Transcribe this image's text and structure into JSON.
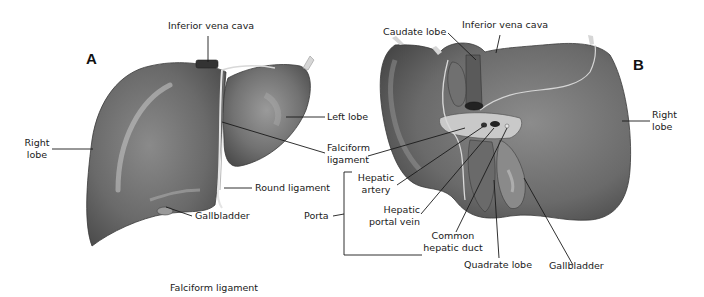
{
  "figure": {
    "panels": [
      {
        "id": "A",
        "letter": "A",
        "view": "anterior",
        "labels": {
          "inferior_vena_cava": "Inferior vena cava",
          "right_lobe_1": "Right",
          "right_lobe_2": "lobe",
          "left_lobe": "Left lobe",
          "falciform_1": "Falciform",
          "falciform_2": "ligament",
          "round_ligament": "Round ligament",
          "gallbladder": "Gallbladder"
        }
      },
      {
        "id": "B",
        "letter": "B",
        "view": "inferior",
        "labels": {
          "caudate_lobe": "Caudate lobe",
          "inferior_vena_cava": "Inferior vena cava",
          "right_lobe_1": "Right",
          "right_lobe_2": "lobe",
          "porta": "Porta",
          "hepatic_artery_1": "Hepatic",
          "hepatic_artery_2": "artery",
          "hepatic_portal_vein_1": "Hepatic",
          "hepatic_portal_vein_2": "portal vein",
          "common_hepatic_duct_1": "Common",
          "common_hepatic_duct_2": "hepatic duct",
          "quadrate_lobe": "Quadrate lobe",
          "gallbladder": "Gallbladder"
        }
      }
    ],
    "caption_fragment": "Falciform ligament",
    "colors": {
      "liver_fill": "#6e6e6e",
      "liver_dark": "#4a4a4a",
      "liver_highlight": "#bdbdbd",
      "leader_line": "#1a1a1a",
      "background": "#ffffff"
    }
  }
}
